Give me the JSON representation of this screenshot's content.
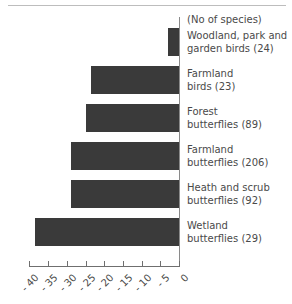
{
  "chart_data": {
    "type": "bar",
    "orientation": "horizontal",
    "title": "",
    "subtitle": "",
    "xlabel": "",
    "ylabel": "",
    "units_note": "(No of species)",
    "xlim": [
      -40,
      0
    ],
    "xticks": [
      -40,
      -35,
      -30,
      -25,
      -20,
      -15,
      -10,
      -5,
      0
    ],
    "xtick_labels": [
      "- 40",
      "- 35",
      "- 30",
      "- 25",
      "- 20",
      "- 15",
      "- 10",
      "- 5",
      "0"
    ],
    "grid": false,
    "legend": "none",
    "bar_color": "#3a3a3a",
    "categories": [
      "Woodland, park and garden birds (24)",
      "Farmland birds  (23)",
      "Forest butterflies (89)",
      "Farmland butterflies (206)",
      "Heath and scrub butterflies (92)",
      "Wetland butterflies  (29)"
    ],
    "values": [
      -3,
      -23.5,
      -25,
      -29,
      -29,
      -38.5
    ],
    "species_counts": [
      24,
      23,
      89,
      206,
      92,
      29
    ]
  },
  "labels": {
    "units": "(No of species)",
    "items": [
      {
        "line1": "Woodland, park and",
        "line2": "garden birds (24)"
      },
      {
        "line1": "Farmland",
        "line2": "birds  (23)"
      },
      {
        "line1": "Forest",
        "line2": "butterflies (89)"
      },
      {
        "line1": "Farmland",
        "line2": "butterflies (206)"
      },
      {
        "line1": "Heath and scrub",
        "line2": "butterflies (92)"
      },
      {
        "line1": "Wetland",
        "line2": "butterflies  (29)"
      }
    ]
  },
  "axis": {
    "tick_labels": [
      "- 40",
      "- 35",
      "- 30",
      "- 25",
      "- 20",
      "- 15",
      "- 10",
      "- 5",
      "0"
    ]
  }
}
